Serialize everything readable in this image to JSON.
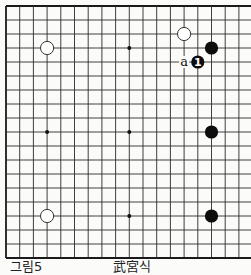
{
  "diagram": {
    "type": "go-board",
    "board_size": 19,
    "visible_columns": 18,
    "grid": {
      "origin_x": 6,
      "origin_y": 6,
      "spacing_x": 13.7,
      "spacing_y": 14.0,
      "line_color": "#2a2a2a",
      "border_color": "#1a1a1a"
    },
    "star_points": [
      {
        "col": 3,
        "row": 3
      },
      {
        "col": 9,
        "row": 3
      },
      {
        "col": 15,
        "row": 3
      },
      {
        "col": 3,
        "row": 9
      },
      {
        "col": 9,
        "row": 9
      },
      {
        "col": 15,
        "row": 9
      },
      {
        "col": 3,
        "row": 15
      },
      {
        "col": 9,
        "row": 15
      },
      {
        "col": 15,
        "row": 15
      }
    ],
    "stones": [
      {
        "color": "white",
        "col": 3,
        "row": 3,
        "label": ""
      },
      {
        "color": "white",
        "col": 13,
        "row": 2,
        "label": ""
      },
      {
        "color": "black",
        "col": 15,
        "row": 3,
        "label": ""
      },
      {
        "color": "black",
        "col": 14,
        "row": 4,
        "label": "1"
      },
      {
        "color": "black",
        "col": 15,
        "row": 9,
        "label": ""
      },
      {
        "color": "black",
        "col": 15,
        "row": 15,
        "label": ""
      },
      {
        "color": "white",
        "col": 3,
        "row": 15,
        "label": ""
      }
    ],
    "markers": [
      {
        "col": 13,
        "row": 4,
        "text": "a"
      }
    ],
    "colors": {
      "black_stone": "#0d0d0d",
      "white_stone_fill": "#ffffff",
      "white_stone_stroke": "#333333",
      "background": "#fbfbfa"
    }
  },
  "caption": {
    "figure_label": "그림5",
    "title": "武宮식"
  }
}
